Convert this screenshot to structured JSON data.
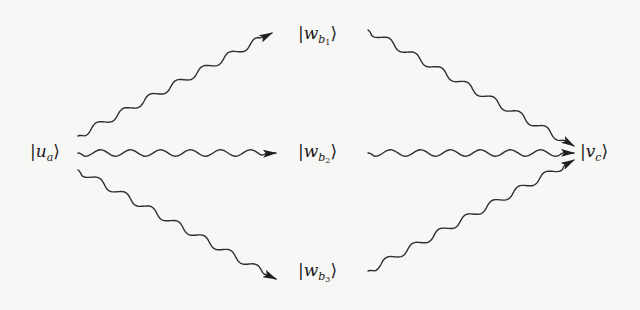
{
  "diagram": {
    "type": "wavy-arrow state transition diagram",
    "nodes": [
      {
        "id": "u_a",
        "ket": "u",
        "subscript": "a",
        "subsub": "",
        "display": "|u_a⟩",
        "x": 30,
        "y": 143
      },
      {
        "id": "w_b1",
        "ket": "w",
        "subscript": "b",
        "subsub": "1",
        "display": "|w_{b_1}⟩",
        "x": 298,
        "y": 25
      },
      {
        "id": "w_b2",
        "ket": "w",
        "subscript": "b",
        "subsub": "2",
        "display": "|w_{b_2}⟩",
        "x": 298,
        "y": 143
      },
      {
        "id": "w_b3",
        "ket": "w",
        "subscript": "b",
        "subsub": "3",
        "display": "|w_{b_3}⟩",
        "x": 298,
        "y": 262
      },
      {
        "id": "v_c",
        "ket": "v",
        "subscript": "c",
        "subsub": "",
        "display": "|v_c⟩",
        "x": 580,
        "y": 143
      }
    ],
    "edges": [
      {
        "from": "u_a",
        "to": "w_b1",
        "style": "wavy-arrow"
      },
      {
        "from": "u_a",
        "to": "w_b2",
        "style": "wavy-arrow"
      },
      {
        "from": "u_a",
        "to": "w_b3",
        "style": "wavy-arrow"
      },
      {
        "from": "w_b1",
        "to": "v_c",
        "style": "wavy-arrow"
      },
      {
        "from": "w_b2",
        "to": "v_c",
        "style": "wavy-arrow"
      },
      {
        "from": "w_b3",
        "to": "v_c",
        "style": "wavy-arrow"
      }
    ],
    "colors": {
      "ink": "#2a2a2a",
      "background": "#f7f7f5"
    }
  },
  "labels": {
    "u_a": {
      "left": "|",
      "letter": "u",
      "sub": "a",
      "subsub": "",
      "right": "⟩"
    },
    "w_b1": {
      "left": "|",
      "letter": "w",
      "sub": "b",
      "subsub": "1",
      "right": "⟩"
    },
    "w_b2": {
      "left": "|",
      "letter": "w",
      "sub": "b",
      "subsub": "2",
      "right": "⟩"
    },
    "w_b3": {
      "left": "|",
      "letter": "w",
      "sub": "b",
      "subsub": "3",
      "right": "⟩"
    },
    "v_c": {
      "left": "|",
      "letter": "v",
      "sub": "c",
      "subsub": "",
      "right": "⟩"
    }
  }
}
